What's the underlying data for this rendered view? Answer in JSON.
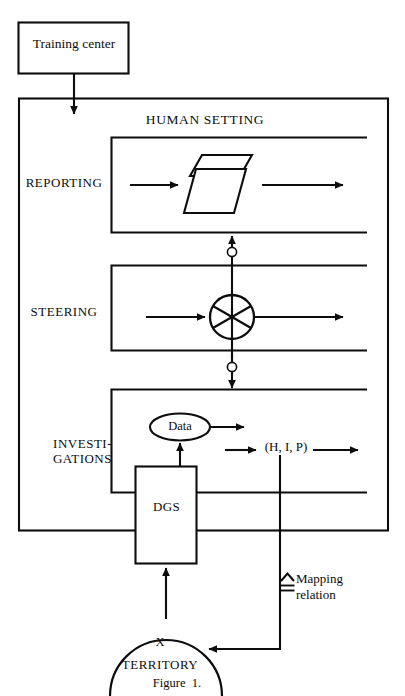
{
  "figure": {
    "caption": "Figure  1.",
    "external_box_label": "Training center",
    "outer_system_label": "HUMAN SETTING",
    "bands": [
      {
        "id": "reporting",
        "label": "REPORTING"
      },
      {
        "id": "steering",
        "label": "STEERING"
      },
      {
        "id": "investigations",
        "label": "INVESTI-\nGATIONS"
      }
    ],
    "nodes": {
      "data_label": "Data",
      "dgs_label": "DGS",
      "hip_label": "(H, I, P)",
      "territory_marker": "X",
      "territory_label": "TERRITORY"
    },
    "legend": {
      "symbol_name": "mapping-relation-symbol",
      "symbol_glyph": "≙",
      "text_line1": "Mapping",
      "text_line2": "relation"
    },
    "colors": {
      "ink": "#0d0d0d",
      "paper": "#ffffff"
    }
  }
}
